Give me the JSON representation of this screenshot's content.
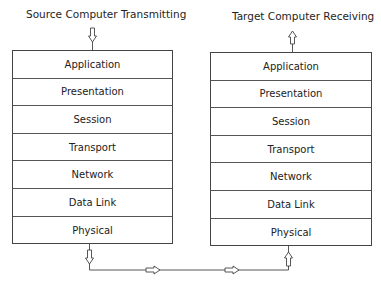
{
  "source": {
    "title": "Source Computer Transmitting",
    "layers": [
      "Application",
      "Presentation",
      "Session",
      "Transport",
      "Network",
      "Data Link",
      "Physical"
    ]
  },
  "target": {
    "title": "Target Computer Receiving",
    "layers": [
      "Application",
      "Presentation",
      "Session",
      "Transport",
      "Network",
      "Data Link",
      "Physical"
    ]
  },
  "arrows": {
    "source_in": "down-arrow-icon",
    "target_out": "up-arrow-icon",
    "source_down": "down-arrow-icon",
    "link_right_1": "right-arrow-icon",
    "link_right_2": "right-arrow-icon",
    "target_up": "up-arrow-icon"
  }
}
